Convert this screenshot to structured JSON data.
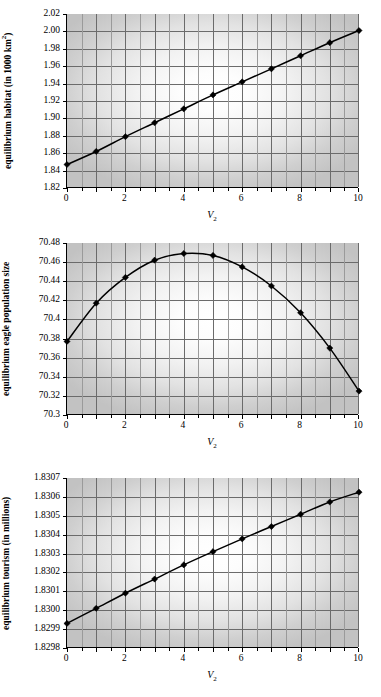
{
  "figure": {
    "xlabel_main": "V",
    "xlabel_sub": "2",
    "background": "#ffffff",
    "line_color": "#000000",
    "marker_color": "#000000"
  },
  "chart_data": [
    {
      "id": "chart1",
      "type": "line",
      "title": "",
      "ylabel": "equilibrium habitat (in 1000 km²)",
      "ylabel_main": "equilibrium habitat (in 1000 km",
      "ylabel_sup": "2",
      "ylabel_tail": ")",
      "xlabel": "V2",
      "x": [
        0,
        1,
        2,
        3,
        4,
        5,
        6,
        7,
        8,
        9,
        10
      ],
      "values": [
        1.847,
        1.862,
        1.879,
        1.895,
        1.911,
        1.927,
        1.942,
        1.957,
        1.972,
        1.987,
        2.001
      ],
      "xlim": [
        0,
        10
      ],
      "ylim": [
        1.82,
        2.02
      ],
      "xticks": [
        0,
        2,
        4,
        6,
        8,
        10
      ],
      "xticklabels": [
        "0",
        "2",
        "4",
        "6",
        "8",
        "10"
      ],
      "yticks": [
        1.82,
        1.84,
        1.86,
        1.88,
        1.9,
        1.92,
        1.94,
        1.96,
        1.98,
        2.0,
        2.02
      ],
      "yticklabels": [
        "1.82",
        "1.84",
        "1.86",
        "1.88",
        "1.90",
        "1.92",
        "1.94",
        "1.96",
        "1.98",
        "2.00",
        "2.02"
      ],
      "grid": true,
      "marker": "diamond",
      "legend": "none"
    },
    {
      "id": "chart2",
      "type": "line",
      "title": "",
      "ylabel": "equilibrium eagle population size",
      "ylabel_main": "equilibrium eagle population size",
      "ylabel_sup": "",
      "ylabel_tail": "",
      "xlabel": "V2",
      "x": [
        0,
        1,
        2,
        3,
        4,
        5,
        6,
        7,
        8,
        9,
        10
      ],
      "values": [
        70.377,
        70.417,
        70.444,
        70.462,
        70.469,
        70.467,
        70.455,
        70.435,
        70.407,
        70.37,
        70.325
      ],
      "xlim": [
        0,
        10
      ],
      "ylim": [
        70.3,
        70.48
      ],
      "xticks": [
        0,
        2,
        4,
        6,
        8,
        10
      ],
      "xticklabels": [
        "0",
        "2",
        "4",
        "6",
        "8",
        "10"
      ],
      "yticks": [
        70.3,
        70.32,
        70.34,
        70.36,
        70.38,
        70.4,
        70.42,
        70.44,
        70.46,
        70.48
      ],
      "yticklabels": [
        "70.3",
        "70.32",
        "70.34",
        "70.36",
        "70.38",
        "70.4",
        "70.42",
        "70.44",
        "70.46",
        "70.48"
      ],
      "grid": true,
      "marker": "diamond",
      "legend": "none"
    },
    {
      "id": "chart3",
      "type": "line",
      "title": "",
      "ylabel": "equilibrium tourism (in millions)",
      "ylabel_main": "equilibrium tourism (in millions)",
      "ylabel_sup": "",
      "ylabel_tail": "",
      "xlabel": "V2",
      "x": [
        0,
        1,
        2,
        3,
        4,
        5,
        6,
        7,
        8,
        9,
        10
      ],
      "values": [
        1.82993,
        1.83001,
        1.83009,
        1.830165,
        1.83024,
        1.83031,
        1.830378,
        1.830443,
        1.830508,
        1.830573,
        1.830625
      ],
      "xlim": [
        0,
        10
      ],
      "ylim": [
        1.8298,
        1.8307
      ],
      "xticks": [
        0,
        2,
        4,
        6,
        8,
        10
      ],
      "xticklabels": [
        "0",
        "2",
        "4",
        "6",
        "8",
        "10"
      ],
      "yticks": [
        1.8298,
        1.8299,
        1.83,
        1.8301,
        1.8302,
        1.8303,
        1.8304,
        1.8305,
        1.8306,
        1.8307
      ],
      "yticklabels": [
        "1.8298",
        "1.8299",
        "1.8300",
        "1.8301",
        "1.8302",
        "1.8303",
        "1.8304",
        "1.8305",
        "1.8306",
        "1.8307"
      ],
      "grid": true,
      "marker": "diamond",
      "legend": "none"
    }
  ]
}
